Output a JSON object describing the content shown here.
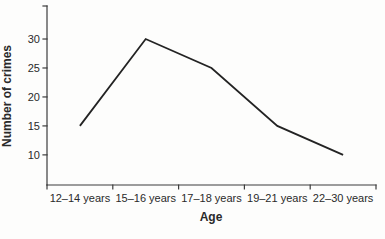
{
  "chart_data": {
    "type": "line",
    "categories": [
      "12–14 years",
      "15–16 years",
      "17–18 years",
      "19–21 years",
      "22–30 years"
    ],
    "values": [
      15,
      30,
      25,
      15,
      10
    ],
    "title": "",
    "xlabel": "Age",
    "ylabel": "Number of crimes",
    "yticks": [
      10,
      15,
      20,
      25,
      30
    ],
    "ylim": [
      4.8,
      35.7
    ],
    "grid": false,
    "legend": false,
    "line_color": "#232323",
    "axis_color": "#3c3c3c",
    "background": "#fdfdfc"
  }
}
